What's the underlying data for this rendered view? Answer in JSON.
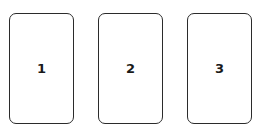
{
  "cards": [
    {
      "label": "1"
    },
    {
      "label": "2"
    },
    {
      "label": "3"
    }
  ],
  "colors": {
    "background": "#ffffff",
    "border": "#2b2b2b",
    "text": "#1a1a1a"
  }
}
